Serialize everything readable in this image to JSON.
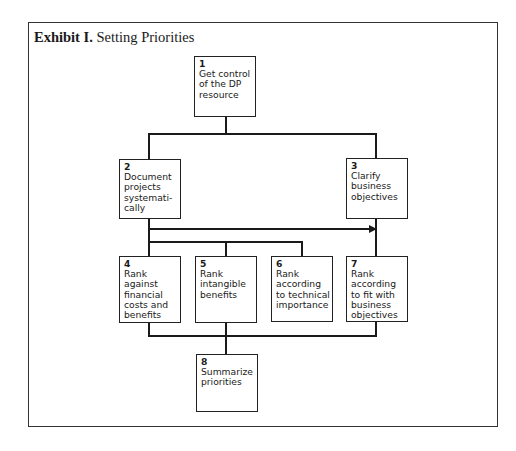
{
  "exhibit": {
    "label": "Exhibit I.",
    "title": "Setting Priorities"
  },
  "steps": [
    {
      "num": "1",
      "text": "Get control\nof the DP\nresource"
    },
    {
      "num": "2",
      "text": "Document\nprojects\nsystemati-\ncally"
    },
    {
      "num": "3",
      "text": "Clarify\nbusiness\nobjectives"
    },
    {
      "num": "4",
      "text": "Rank\nagainst\nfinancial\ncosts and\nbenefits"
    },
    {
      "num": "5",
      "text": "Rank\nintangible\nbenefits"
    },
    {
      "num": "6",
      "text": "Rank\naccording\nto technical\nimportance"
    },
    {
      "num": "7",
      "text": "Rank\naccording\nto fit with\nbusiness\nobjectives"
    },
    {
      "num": "8",
      "text": "Summarize\npriorities"
    }
  ],
  "connections": [
    {
      "from": "1",
      "to": "2"
    },
    {
      "from": "1",
      "to": "3"
    },
    {
      "from": "2",
      "to": "3",
      "arrow": true
    },
    {
      "from": "2",
      "to": "4"
    },
    {
      "from": "2",
      "to": "5"
    },
    {
      "from": "2",
      "to": "6"
    },
    {
      "from": "3",
      "to": "7"
    },
    {
      "from": "4",
      "to": "8"
    },
    {
      "from": "5",
      "to": "8"
    },
    {
      "from": "6",
      "to": "8"
    },
    {
      "from": "7",
      "to": "8"
    }
  ]
}
